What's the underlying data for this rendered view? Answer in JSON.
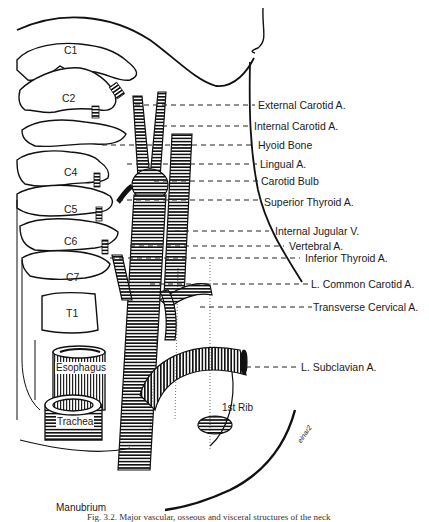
{
  "figure": {
    "caption": "Fig. 3.2. Major vascular, osseous and visceral structures of the neck",
    "artist_signature": "einar2"
  },
  "vertebrae": [
    {
      "label": "C1",
      "x": 64,
      "y": 50
    },
    {
      "label": "C2",
      "x": 62,
      "y": 93
    },
    {
      "label": "C4",
      "x": 64,
      "y": 172
    },
    {
      "label": "C5",
      "x": 64,
      "y": 206
    },
    {
      "label": "C6",
      "x": 64,
      "y": 239
    },
    {
      "label": "C7",
      "x": 66,
      "y": 268
    },
    {
      "label": "T1",
      "x": 66,
      "y": 306
    }
  ],
  "structures": {
    "esophagus": "Esophagus",
    "trachea": "Trachea",
    "first_rib": "1st Rib",
    "manubrium": "Manubrium"
  },
  "labels": [
    {
      "text": "External Carotid A.",
      "x": 258,
      "y": 99
    },
    {
      "text": "Internal Carotid A.",
      "x": 254,
      "y": 120
    },
    {
      "text": "Hyoid Bone",
      "x": 258,
      "y": 139
    },
    {
      "text": "Lingual A.",
      "x": 260,
      "y": 158
    },
    {
      "text": "Carotid Bulb",
      "x": 261,
      "y": 175
    },
    {
      "text": "Superior Thyroid A.",
      "x": 264,
      "y": 196
    },
    {
      "text": "Internal Jugular V.",
      "x": 275,
      "y": 225
    },
    {
      "text": "Vertebral A.",
      "x": 289,
      "y": 239
    },
    {
      "text": "Inferior Thyroid A.",
      "x": 305,
      "y": 252
    },
    {
      "text": "L. Common Carotid A.",
      "x": 311,
      "y": 273
    },
    {
      "text": "Transverse Cervical A.",
      "x": 313,
      "y": 291
    },
    {
      "text": "L. Subclavian A.",
      "x": 301,
      "y": 363
    }
  ]
}
